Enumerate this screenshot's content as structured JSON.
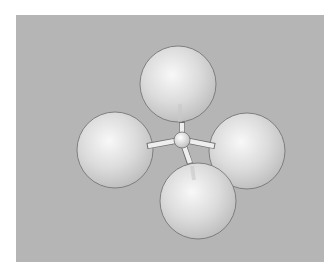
{
  "figure": {
    "central_atom": {
      "label": ""
    },
    "outer_atoms": [
      {
        "position": "top",
        "label": ""
      },
      {
        "position": "left",
        "label": ""
      },
      {
        "position": "right",
        "label": ""
      },
      {
        "position": "bottom",
        "label": ""
      }
    ],
    "bond_count": 4
  },
  "colors": {
    "background_panel": "#b5b5b5",
    "page": "#ffffff",
    "sphere_highlight": "#f6f6f6",
    "sphere_shade": "#c2c2c2",
    "sphere_outline": "#6e6e6e",
    "bond": "#e8e8e8"
  }
}
